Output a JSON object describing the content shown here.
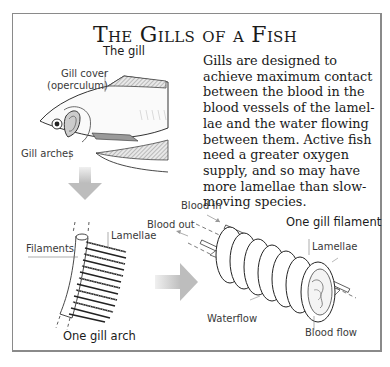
{
  "title": "The Gills of a Fish",
  "description_lines": [
    "Gills are designed to",
    "achieve maximum contact",
    "between the blood in the",
    "blood vessels of the lamel-",
    "lae and the water flowing",
    "between them. Active fish",
    "need a  greater oxygen",
    "supply, and so may have",
    "more lamellae than slow-",
    "moving species."
  ],
  "fish_panel": {
    "heading": "The gill",
    "labels": {
      "gill_cover_1": "Gill cover",
      "gill_cover_2": "(operculum)",
      "gill_arches": "Gill arches"
    }
  },
  "arch_panel": {
    "heading": "One gill arch",
    "labels": {
      "filaments": "Filaments",
      "lamellae": "Lamellae"
    }
  },
  "filament_panel": {
    "heading": "One gill filament",
    "labels": {
      "blood_in": "Blood in",
      "blood_out": "Blood out",
      "lamellae": "Lamellae",
      "waterflow": "Waterflow",
      "blood_flow": "Blood flow"
    }
  },
  "colors": {
    "frame": "#8a8a8a",
    "arrow": "#c4c4c4",
    "ink": "#1a1a1a",
    "hatch": "#9a9a9a"
  }
}
